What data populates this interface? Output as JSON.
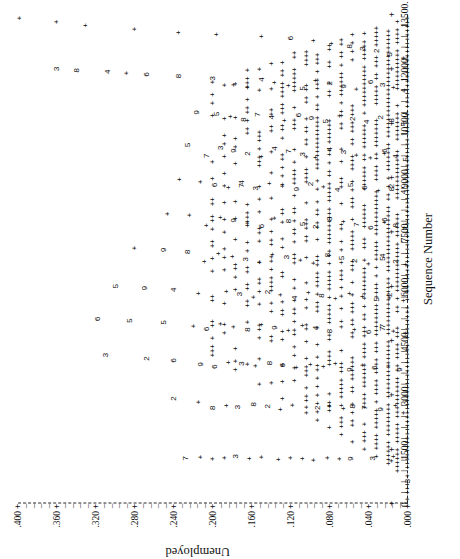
{
  "figure": {
    "rotation_note": "plot printed sideways (rotated 90 degrees counter-clockwise)",
    "xlabel": "Sequence Number",
    "ylabel": "Unemployed",
    "plot_symbol": "+",
    "overplot_note": "digits indicate number of coincident points"
  },
  "chart_data": {
    "type": "scatter",
    "title": "",
    "xlabel": "Sequence Number",
    "ylabel": "Unemployed",
    "xlim": [
      0,
      13500
    ],
    "ylim": [
      0.0,
      0.4
    ],
    "grid": false,
    "legend": "none",
    "x_ticks": [
      0,
      1500,
      3000,
      4500,
      6000,
      7500,
      9000,
      10500,
      12000,
      13500
    ],
    "x_tick_labels": [
      "0.",
      "1500.",
      "3000.",
      "4500.",
      "6000.",
      "7500.",
      "9000.",
      "10500.",
      "12000.",
      "13500."
    ],
    "y_ticks": [
      0.0,
      0.04,
      0.08,
      0.12,
      0.16,
      0.2,
      0.24,
      0.28,
      0.32,
      0.36,
      0.4
    ],
    "y_tick_labels": [
      ".000",
      ".040",
      ".080",
      ".120",
      ".160",
      ".200",
      ".240",
      ".280",
      ".320",
      ".360",
      ".400"
    ],
    "marker": "+",
    "overplot_digits": true,
    "points": [
      {
        "x": 120,
        "y": 0.0,
        "g": "+"
      },
      {
        "x": 620,
        "y": 0.0,
        "g": "3"
      },
      {
        "x": 1180,
        "y": 0.016,
        "g": "+"
      },
      {
        "x": 1300,
        "y": 0.014,
        "g": "+"
      },
      {
        "x": 1250,
        "y": 0.036,
        "g": "3"
      },
      {
        "x": 1240,
        "y": 0.058,
        "g": "9"
      },
      {
        "x": 1230,
        "y": 0.07,
        "g": "+"
      },
      {
        "x": 1260,
        "y": 0.082,
        "g": "+"
      },
      {
        "x": 1200,
        "y": 0.096,
        "g": "+"
      },
      {
        "x": 1240,
        "y": 0.108,
        "g": "+"
      },
      {
        "x": 1260,
        "y": 0.12,
        "g": "+"
      },
      {
        "x": 1220,
        "y": 0.132,
        "g": "+"
      },
      {
        "x": 1280,
        "y": 0.15,
        "g": "+"
      },
      {
        "x": 1240,
        "y": 0.162,
        "g": "+"
      },
      {
        "x": 1300,
        "y": 0.176,
        "g": "3"
      },
      {
        "x": 1260,
        "y": 0.188,
        "g": "+"
      },
      {
        "x": 1230,
        "y": 0.2,
        "g": "+"
      },
      {
        "x": 1280,
        "y": 0.212,
        "g": "+"
      },
      {
        "x": 1250,
        "y": 0.228,
        "g": "7"
      },
      {
        "x": 2500,
        "y": 0.004,
        "g": "+"
      },
      {
        "x": 2700,
        "y": 0.012,
        "g": "+"
      },
      {
        "x": 2600,
        "y": 0.028,
        "g": "9"
      },
      {
        "x": 2650,
        "y": 0.044,
        "g": "7"
      },
      {
        "x": 2680,
        "y": 0.056,
        "g": "8"
      },
      {
        "x": 2620,
        "y": 0.066,
        "g": "+"
      },
      {
        "x": 2700,
        "y": 0.08,
        "g": "+"
      },
      {
        "x": 2640,
        "y": 0.092,
        "g": "2"
      },
      {
        "x": 2660,
        "y": 0.104,
        "g": "+"
      },
      {
        "x": 2720,
        "y": 0.118,
        "g": "+"
      },
      {
        "x": 2600,
        "y": 0.13,
        "g": "+"
      },
      {
        "x": 2680,
        "y": 0.144,
        "g": "2"
      },
      {
        "x": 2740,
        "y": 0.158,
        "g": "8"
      },
      {
        "x": 2660,
        "y": 0.174,
        "g": "3"
      },
      {
        "x": 2700,
        "y": 0.186,
        "g": "+"
      },
      {
        "x": 2640,
        "y": 0.2,
        "g": "8"
      },
      {
        "x": 2800,
        "y": 0.214,
        "g": "+"
      },
      {
        "x": 2900,
        "y": 0.24,
        "g": "2"
      },
      {
        "x": 3700,
        "y": 0.008,
        "g": "9"
      },
      {
        "x": 3800,
        "y": 0.02,
        "g": "+"
      },
      {
        "x": 3750,
        "y": 0.034,
        "g": "6"
      },
      {
        "x": 3820,
        "y": 0.046,
        "g": "+"
      },
      {
        "x": 3700,
        "y": 0.06,
        "g": "9"
      },
      {
        "x": 3860,
        "y": 0.074,
        "g": "+"
      },
      {
        "x": 3780,
        "y": 0.086,
        "g": "+"
      },
      {
        "x": 3840,
        "y": 0.1,
        "g": "+"
      },
      {
        "x": 3760,
        "y": 0.114,
        "g": "+"
      },
      {
        "x": 3820,
        "y": 0.128,
        "g": "6"
      },
      {
        "x": 3880,
        "y": 0.142,
        "g": "8"
      },
      {
        "x": 3800,
        "y": 0.156,
        "g": "+"
      },
      {
        "x": 3860,
        "y": 0.17,
        "g": "3"
      },
      {
        "x": 3900,
        "y": 0.184,
        "g": "+"
      },
      {
        "x": 3780,
        "y": 0.198,
        "g": "6"
      },
      {
        "x": 3840,
        "y": 0.212,
        "g": "9"
      },
      {
        "x": 3950,
        "y": 0.24,
        "g": "6"
      },
      {
        "x": 4000,
        "y": 0.268,
        "g": "2"
      },
      {
        "x": 4100,
        "y": 0.31,
        "g": "3"
      },
      {
        "x": 4700,
        "y": 0.002,
        "g": "+"
      },
      {
        "x": 4760,
        "y": 0.014,
        "g": "+"
      },
      {
        "x": 4820,
        "y": 0.026,
        "g": "7"
      },
      {
        "x": 4900,
        "y": 0.026,
        "g": "7"
      },
      {
        "x": 4740,
        "y": 0.04,
        "g": "6"
      },
      {
        "x": 4800,
        "y": 0.054,
        "g": "+"
      },
      {
        "x": 4880,
        "y": 0.068,
        "g": "+"
      },
      {
        "x": 4760,
        "y": 0.08,
        "g": "8"
      },
      {
        "x": 4840,
        "y": 0.094,
        "g": "4"
      },
      {
        "x": 4920,
        "y": 0.108,
        "g": "+"
      },
      {
        "x": 4780,
        "y": 0.122,
        "g": "+"
      },
      {
        "x": 4860,
        "y": 0.136,
        "g": "9"
      },
      {
        "x": 4940,
        "y": 0.15,
        "g": "+"
      },
      {
        "x": 4800,
        "y": 0.164,
        "g": "8"
      },
      {
        "x": 4880,
        "y": 0.178,
        "g": "+"
      },
      {
        "x": 4960,
        "y": 0.192,
        "g": "+"
      },
      {
        "x": 4820,
        "y": 0.206,
        "g": "6"
      },
      {
        "x": 4900,
        "y": 0.22,
        "g": "+"
      },
      {
        "x": 5000,
        "y": 0.25,
        "g": "5"
      },
      {
        "x": 5050,
        "y": 0.285,
        "g": "5"
      },
      {
        "x": 5100,
        "y": 0.318,
        "g": "6"
      },
      {
        "x": 5600,
        "y": 0.004,
        "g": "+"
      },
      {
        "x": 5680,
        "y": 0.018,
        "g": "+"
      },
      {
        "x": 5760,
        "y": 0.018,
        "g": "2"
      },
      {
        "x": 5640,
        "y": 0.032,
        "g": "5"
      },
      {
        "x": 5720,
        "y": 0.046,
        "g": "+"
      },
      {
        "x": 5800,
        "y": 0.06,
        "g": "+"
      },
      {
        "x": 5660,
        "y": 0.074,
        "g": "+"
      },
      {
        "x": 5740,
        "y": 0.088,
        "g": "8"
      },
      {
        "x": 5820,
        "y": 0.102,
        "g": "+"
      },
      {
        "x": 5680,
        "y": 0.116,
        "g": "4"
      },
      {
        "x": 5760,
        "y": 0.13,
        "g": "+"
      },
      {
        "x": 5840,
        "y": 0.144,
        "g": "2"
      },
      {
        "x": 5700,
        "y": 0.158,
        "g": "+"
      },
      {
        "x": 5780,
        "y": 0.172,
        "g": "3"
      },
      {
        "x": 5860,
        "y": 0.186,
        "g": "+"
      },
      {
        "x": 5720,
        "y": 0.2,
        "g": "+"
      },
      {
        "x": 5800,
        "y": 0.214,
        "g": "+"
      },
      {
        "x": 5900,
        "y": 0.24,
        "g": "4"
      },
      {
        "x": 5950,
        "y": 0.27,
        "g": "9"
      },
      {
        "x": 6000,
        "y": 0.3,
        "g": "5"
      },
      {
        "x": 6600,
        "y": 0.002,
        "g": "+"
      },
      {
        "x": 6680,
        "y": 0.012,
        "g": "2"
      },
      {
        "x": 6760,
        "y": 0.026,
        "g": "5"
      },
      {
        "x": 6840,
        "y": 0.026,
        "g": "4"
      },
      {
        "x": 6620,
        "y": 0.04,
        "g": "+"
      },
      {
        "x": 6700,
        "y": 0.054,
        "g": "2"
      },
      {
        "x": 6780,
        "y": 0.068,
        "g": "5"
      },
      {
        "x": 6860,
        "y": 0.082,
        "g": "8"
      },
      {
        "x": 6640,
        "y": 0.096,
        "g": "+"
      },
      {
        "x": 6720,
        "y": 0.11,
        "g": "+"
      },
      {
        "x": 6800,
        "y": 0.124,
        "g": "3"
      },
      {
        "x": 6880,
        "y": 0.138,
        "g": "+"
      },
      {
        "x": 6660,
        "y": 0.152,
        "g": "+"
      },
      {
        "x": 6740,
        "y": 0.166,
        "g": "3"
      },
      {
        "x": 6820,
        "y": 0.18,
        "g": "+"
      },
      {
        "x": 6900,
        "y": 0.194,
        "g": "+"
      },
      {
        "x": 6680,
        "y": 0.208,
        "g": "+"
      },
      {
        "x": 6950,
        "y": 0.226,
        "g": "8"
      },
      {
        "x": 7000,
        "y": 0.25,
        "g": "9"
      },
      {
        "x": 7050,
        "y": 0.28,
        "g": "+"
      },
      {
        "x": 7600,
        "y": 0.002,
        "g": "2"
      },
      {
        "x": 7680,
        "y": 0.012,
        "g": "8"
      },
      {
        "x": 7760,
        "y": 0.024,
        "g": "+"
      },
      {
        "x": 7840,
        "y": 0.024,
        "g": "6"
      },
      {
        "x": 7620,
        "y": 0.038,
        "g": "6"
      },
      {
        "x": 7700,
        "y": 0.052,
        "g": "7"
      },
      {
        "x": 7780,
        "y": 0.066,
        "g": "+"
      },
      {
        "x": 7860,
        "y": 0.08,
        "g": "8"
      },
      {
        "x": 7640,
        "y": 0.094,
        "g": "2"
      },
      {
        "x": 7720,
        "y": 0.108,
        "g": "5"
      },
      {
        "x": 7800,
        "y": 0.122,
        "g": "8"
      },
      {
        "x": 7880,
        "y": 0.136,
        "g": "+"
      },
      {
        "x": 7660,
        "y": 0.15,
        "g": "6"
      },
      {
        "x": 7740,
        "y": 0.164,
        "g": "+"
      },
      {
        "x": 7820,
        "y": 0.178,
        "g": "9"
      },
      {
        "x": 7900,
        "y": 0.192,
        "g": "+"
      },
      {
        "x": 7680,
        "y": 0.206,
        "g": "+"
      },
      {
        "x": 7960,
        "y": 0.224,
        "g": "+"
      },
      {
        "x": 8000,
        "y": 0.246,
        "g": "+"
      },
      {
        "x": 8600,
        "y": 0.004,
        "g": "4"
      },
      {
        "x": 8680,
        "y": 0.016,
        "g": "8"
      },
      {
        "x": 8760,
        "y": 0.016,
        "g": "2"
      },
      {
        "x": 8640,
        "y": 0.03,
        "g": "+"
      },
      {
        "x": 8720,
        "y": 0.044,
        "g": "6"
      },
      {
        "x": 8800,
        "y": 0.058,
        "g": "5"
      },
      {
        "x": 8660,
        "y": 0.072,
        "g": "4"
      },
      {
        "x": 8740,
        "y": 0.086,
        "g": "+"
      },
      {
        "x": 8820,
        "y": 0.1,
        "g": "2"
      },
      {
        "x": 8680,
        "y": 0.114,
        "g": "9"
      },
      {
        "x": 8760,
        "y": 0.128,
        "g": "+"
      },
      {
        "x": 8840,
        "y": 0.142,
        "g": "+"
      },
      {
        "x": 8700,
        "y": 0.156,
        "g": "3"
      },
      {
        "x": 8780,
        "y": 0.17,
        "g": "7"
      },
      {
        "x": 8860,
        "y": 0.17,
        "g": "4"
      },
      {
        "x": 8720,
        "y": 0.184,
        "g": "+"
      },
      {
        "x": 8800,
        "y": 0.198,
        "g": "6"
      },
      {
        "x": 8880,
        "y": 0.212,
        "g": "+"
      },
      {
        "x": 8950,
        "y": 0.234,
        "g": "+"
      },
      {
        "x": 9500,
        "y": 0.002,
        "g": "5"
      },
      {
        "x": 9580,
        "y": 0.012,
        "g": "4"
      },
      {
        "x": 9660,
        "y": 0.024,
        "g": "+"
      },
      {
        "x": 9740,
        "y": 0.024,
        "g": "6"
      },
      {
        "x": 9540,
        "y": 0.038,
        "g": "+"
      },
      {
        "x": 9620,
        "y": 0.052,
        "g": "+"
      },
      {
        "x": 9700,
        "y": 0.066,
        "g": "3"
      },
      {
        "x": 9780,
        "y": 0.08,
        "g": "4"
      },
      {
        "x": 9560,
        "y": 0.094,
        "g": "+"
      },
      {
        "x": 9640,
        "y": 0.108,
        "g": "3"
      },
      {
        "x": 9720,
        "y": 0.122,
        "g": "7"
      },
      {
        "x": 9800,
        "y": 0.136,
        "g": "4"
      },
      {
        "x": 9580,
        "y": 0.15,
        "g": "+"
      },
      {
        "x": 9660,
        "y": 0.164,
        "g": "2"
      },
      {
        "x": 9740,
        "y": 0.178,
        "g": "9"
      },
      {
        "x": 9820,
        "y": 0.192,
        "g": "3"
      },
      {
        "x": 9600,
        "y": 0.206,
        "g": "7"
      },
      {
        "x": 9900,
        "y": 0.226,
        "g": "5"
      },
      {
        "x": 10500,
        "y": 0.004,
        "g": "+"
      },
      {
        "x": 10580,
        "y": 0.016,
        "g": "8"
      },
      {
        "x": 10660,
        "y": 0.028,
        "g": "2"
      },
      {
        "x": 10540,
        "y": 0.042,
        "g": "4"
      },
      {
        "x": 10620,
        "y": 0.056,
        "g": "2"
      },
      {
        "x": 10700,
        "y": 0.07,
        "g": "+"
      },
      {
        "x": 10560,
        "y": 0.084,
        "g": "5"
      },
      {
        "x": 10640,
        "y": 0.098,
        "g": "9"
      },
      {
        "x": 10720,
        "y": 0.112,
        "g": "6"
      },
      {
        "x": 10580,
        "y": 0.126,
        "g": "+"
      },
      {
        "x": 10660,
        "y": 0.14,
        "g": "4"
      },
      {
        "x": 10740,
        "y": 0.154,
        "g": "7"
      },
      {
        "x": 10600,
        "y": 0.168,
        "g": "8"
      },
      {
        "x": 10680,
        "y": 0.182,
        "g": "+"
      },
      {
        "x": 10760,
        "y": 0.196,
        "g": "5"
      },
      {
        "x": 10800,
        "y": 0.216,
        "g": "9"
      },
      {
        "x": 11400,
        "y": 0.004,
        "g": "4"
      },
      {
        "x": 11480,
        "y": 0.014,
        "g": "+"
      },
      {
        "x": 11560,
        "y": 0.026,
        "g": "3"
      },
      {
        "x": 11640,
        "y": 0.038,
        "g": "6"
      },
      {
        "x": 11440,
        "y": 0.052,
        "g": "+"
      },
      {
        "x": 11520,
        "y": 0.066,
        "g": "9"
      },
      {
        "x": 11600,
        "y": 0.08,
        "g": "2"
      },
      {
        "x": 11680,
        "y": 0.094,
        "g": "+"
      },
      {
        "x": 11460,
        "y": 0.108,
        "g": "5"
      },
      {
        "x": 11540,
        "y": 0.122,
        "g": "+"
      },
      {
        "x": 11620,
        "y": 0.136,
        "g": "+"
      },
      {
        "x": 11700,
        "y": 0.15,
        "g": "4"
      },
      {
        "x": 11480,
        "y": 0.164,
        "g": "+"
      },
      {
        "x": 11560,
        "y": 0.178,
        "g": "+"
      },
      {
        "x": 11740,
        "y": 0.2,
        "g": "3"
      },
      {
        "x": 11800,
        "y": 0.235,
        "g": "8"
      },
      {
        "x": 11850,
        "y": 0.268,
        "g": "6"
      },
      {
        "x": 11880,
        "y": 0.288,
        "g": "+"
      },
      {
        "x": 11920,
        "y": 0.308,
        "g": "4"
      },
      {
        "x": 11960,
        "y": 0.34,
        "g": "8"
      },
      {
        "x": 12000,
        "y": 0.36,
        "g": "3"
      },
      {
        "x": 12300,
        "y": 0.004,
        "g": "+"
      },
      {
        "x": 12400,
        "y": 0.018,
        "g": "5"
      },
      {
        "x": 12500,
        "y": 0.032,
        "g": "2"
      },
      {
        "x": 12560,
        "y": 0.046,
        "g": "3"
      },
      {
        "x": 12620,
        "y": 0.06,
        "g": "8"
      },
      {
        "x": 12700,
        "y": 0.078,
        "g": "+"
      },
      {
        "x": 12780,
        "y": 0.096,
        "g": "+"
      },
      {
        "x": 12850,
        "y": 0.12,
        "g": "6"
      },
      {
        "x": 12900,
        "y": 0.15,
        "g": "+"
      },
      {
        "x": 12950,
        "y": 0.196,
        "g": "+"
      },
      {
        "x": 13000,
        "y": 0.235,
        "g": "+"
      },
      {
        "x": 13100,
        "y": 0.28,
        "g": "+"
      },
      {
        "x": 13200,
        "y": 0.33,
        "g": "+"
      },
      {
        "x": 13300,
        "y": 0.36,
        "g": "+"
      },
      {
        "x": 13400,
        "y": 0.398,
        "g": "+"
      }
    ],
    "dense_rows": [
      {
        "y": 0.0,
        "x_from": 300,
        "x_to": 13450,
        "density": 0.9
      },
      {
        "y": 0.01,
        "x_from": 900,
        "x_to": 13350,
        "density": 0.84
      },
      {
        "y": 0.02,
        "x_from": 1100,
        "x_to": 13250,
        "density": 0.8
      },
      {
        "y": 0.032,
        "x_from": 1300,
        "x_to": 13150,
        "density": 0.76
      },
      {
        "y": 0.044,
        "x_from": 1500,
        "x_to": 13050,
        "density": 0.72
      },
      {
        "y": 0.056,
        "x_from": 1700,
        "x_to": 12950,
        "density": 0.68
      },
      {
        "y": 0.068,
        "x_from": 1900,
        "x_to": 12850,
        "density": 0.64
      },
      {
        "y": 0.08,
        "x_from": 2100,
        "x_to": 12750,
        "density": 0.6
      },
      {
        "y": 0.092,
        "x_from": 2300,
        "x_to": 12650,
        "density": 0.56
      },
      {
        "y": 0.104,
        "x_from": 2500,
        "x_to": 12550,
        "density": 0.52
      },
      {
        "y": 0.116,
        "x_from": 2700,
        "x_to": 12450,
        "density": 0.48
      },
      {
        "y": 0.128,
        "x_from": 2900,
        "x_to": 12350,
        "density": 0.44
      },
      {
        "y": 0.14,
        "x_from": 3100,
        "x_to": 12250,
        "density": 0.4
      },
      {
        "y": 0.152,
        "x_from": 3300,
        "x_to": 12150,
        "density": 0.36
      },
      {
        "y": 0.164,
        "x_from": 3500,
        "x_to": 12050,
        "density": 0.32
      },
      {
        "y": 0.176,
        "x_from": 3700,
        "x_to": 11950,
        "density": 0.28
      },
      {
        "y": 0.188,
        "x_from": 3900,
        "x_to": 11850,
        "density": 0.24
      },
      {
        "y": 0.2,
        "x_from": 4100,
        "x_to": 11750,
        "density": 0.2
      }
    ]
  }
}
